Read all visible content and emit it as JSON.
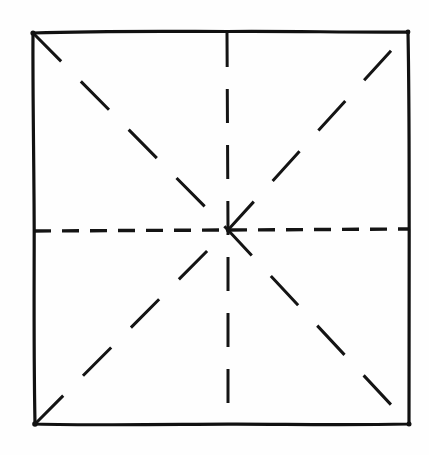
{
  "document": {
    "title": "Origami Fold Pattern",
    "type": "line-drawing",
    "medium": "hand-drawn ink on white paper",
    "background_color": "#fefefe",
    "ink_color": "#141414"
  },
  "canvas": {
    "width": 429,
    "height": 455
  },
  "figure": {
    "name": "square-with-eight-fold-creases",
    "description": "A hand-drawn square sheet with solid outline and four dashed fold creases (horizontal, vertical, and both diagonals) meeting at the centre point.",
    "square": {
      "label": "paper-outline",
      "stroke_width": 3.2,
      "corners": {
        "top_left": {
          "x": 33,
          "y": 33
        },
        "top_right": {
          "x": 408,
          "y": 32
        },
        "bottom_right": {
          "x": 409,
          "y": 424
        },
        "bottom_left": {
          "x": 35,
          "y": 424
        }
      },
      "edges": [
        {
          "name": "top-edge",
          "style": "solid"
        },
        {
          "name": "right-edge",
          "style": "solid"
        },
        {
          "name": "bottom-edge",
          "style": "solid"
        },
        {
          "name": "left-edge",
          "style": "solid"
        }
      ]
    },
    "center_point": {
      "x": 228,
      "y": 230
    },
    "creases": [
      {
        "name": "horizontal-crease",
        "style": "dashed",
        "stroke_width": 3.4,
        "dash_pattern": "17 11",
        "from": {
          "x": 34,
          "y": 231
        },
        "to": {
          "x": 408,
          "y": 229
        }
      },
      {
        "name": "vertical-crease",
        "style": "dashed",
        "stroke_width": 3.0,
        "dash_pattern": "34 22",
        "from": {
          "x": 227,
          "y": 33
        },
        "to": {
          "x": 228,
          "y": 424
        }
      },
      {
        "name": "diagonal-crease-tl-br",
        "style": "dashed",
        "stroke_width": 3.0,
        "dash_pattern": "40 28",
        "from": {
          "x": 33,
          "y": 33
        },
        "to": {
          "x": 409,
          "y": 424
        }
      },
      {
        "name": "diagonal-crease-bl-tr",
        "style": "dashed",
        "stroke_width": 3.0,
        "dash_pattern": "40 28",
        "from": {
          "x": 35,
          "y": 424
        },
        "to": {
          "x": 408,
          "y": 32
        }
      }
    ]
  },
  "chart_data": {
    "type": "line",
    "xlabel": "",
    "ylabel": "",
    "xlim": [
      0,
      429
    ],
    "ylim": [
      455,
      0
    ],
    "grid": false,
    "legend": "none",
    "series": [
      {
        "name": "paper-outline",
        "style": "solid",
        "x": [
          33,
          408,
          409,
          35,
          33
        ],
        "y": [
          33,
          32,
          424,
          424,
          33
        ]
      },
      {
        "name": "horizontal-crease",
        "style": "dashed",
        "x": [
          34,
          408
        ],
        "y": [
          231,
          229
        ]
      },
      {
        "name": "vertical-crease",
        "style": "dashed",
        "x": [
          227,
          228
        ],
        "y": [
          33,
          424
        ]
      },
      {
        "name": "diagonal-crease-tl-br",
        "style": "dashed",
        "x": [
          33,
          409
        ],
        "y": [
          33,
          424
        ]
      },
      {
        "name": "diagonal-crease-bl-tr",
        "style": "dashed",
        "x": [
          35,
          408
        ],
        "y": [
          424,
          32
        ]
      }
    ]
  }
}
